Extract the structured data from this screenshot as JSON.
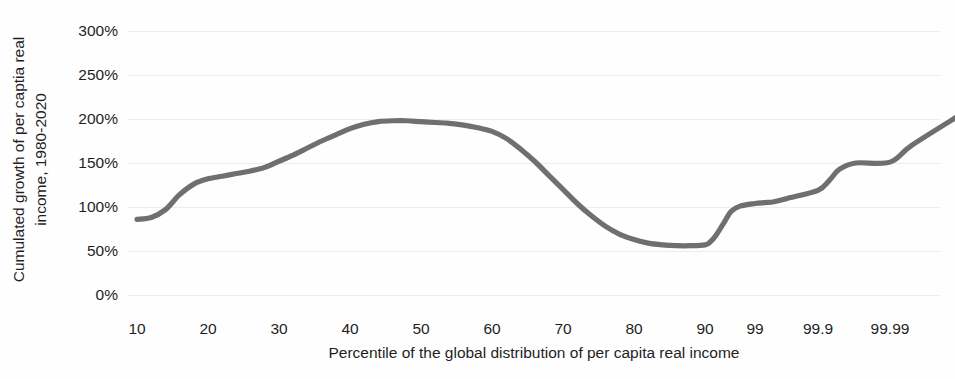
{
  "chart_data": {
    "type": "line",
    "title": "",
    "xlabel": "Percentile of the global distribution of per capita real income",
    "ylabel_line1": "Cumulated growth of per captia real",
    "ylabel_line2": "income, 1980-2020",
    "ylabel": "Cumulated growth of per captia real income, 1980-2020",
    "grid": true,
    "legend": "none",
    "line_color": "#6f6f6f",
    "grid_color": "#ededed",
    "ylim": [
      0,
      300
    ],
    "yticks": [
      0,
      50,
      100,
      150,
      200,
      250,
      300
    ],
    "ytick_labels": [
      "0%",
      "50%",
      "100%",
      "150%",
      "200%",
      "250%",
      "300%"
    ],
    "xtick_labels": [
      "10",
      "20",
      "30",
      "40",
      "50",
      "60",
      "70",
      "80",
      "90",
      "99",
      "99.9",
      "99.99"
    ],
    "xtick_positions": [
      10,
      20,
      30,
      40,
      50,
      60,
      70,
      80,
      90,
      99,
      99.9,
      99.99
    ],
    "x": [
      10,
      12,
      14,
      16,
      18,
      20,
      22,
      24,
      26,
      28,
      30,
      32,
      34,
      36,
      38,
      40,
      42,
      44,
      46,
      48,
      50,
      52,
      54,
      56,
      58,
      60,
      62,
      64,
      66,
      68,
      70,
      72,
      74,
      76,
      78,
      80,
      82,
      84,
      86,
      88,
      90,
      92,
      94,
      96,
      97,
      98,
      99,
      99.3,
      99.5,
      99.7,
      99.9,
      99.93,
      99.95,
      99.97,
      99.99,
      99.995,
      99.999
    ],
    "values": [
      86,
      88,
      97,
      114,
      126,
      132,
      135,
      138,
      141,
      145,
      152,
      159,
      167,
      175,
      182,
      189,
      194,
      197,
      198,
      198,
      197,
      196,
      195,
      193,
      190,
      186,
      178,
      166,
      152,
      136,
      120,
      104,
      90,
      78,
      69,
      63,
      59,
      57,
      56,
      56,
      57,
      60,
      68,
      84,
      95,
      101,
      104,
      105,
      106,
      110,
      119,
      130,
      143,
      150,
      151,
      170,
      206
    ],
    "annotations": []
  }
}
